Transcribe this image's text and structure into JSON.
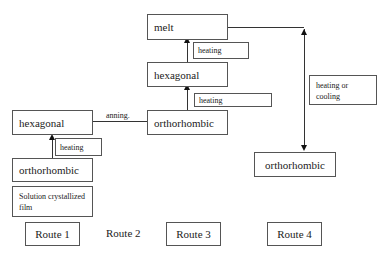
{
  "diagram": {
    "nodes": {
      "melt": "melt",
      "hexagonal_route3": "hexagonal",
      "orthorhombic_route3": "orthorhombic",
      "hexagonal_route1": "hexagonal",
      "orthorhombic_route1": "orthorhombic",
      "solution_film": "Solution crystallized film",
      "orthorhombic_route4": "orthorhombic"
    },
    "edge_labels": {
      "heating_top": "heating",
      "heating_mid": "heating",
      "heating_left": "heating",
      "annealing": "anning.",
      "heating_or_cooling": "heating or cooling"
    },
    "routes": [
      "Route 1",
      "Route 2",
      "Route 3",
      "Route 4"
    ]
  }
}
